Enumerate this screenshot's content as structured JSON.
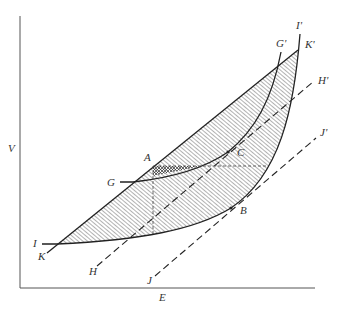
{
  "axes": {
    "x_label": "E",
    "y_label": "V"
  },
  "points": {
    "A": "A",
    "B": "B",
    "C": "C",
    "G": "G",
    "G_prime": "G'",
    "H": "H",
    "H_prime": "H'",
    "I": "I",
    "I_prime": "I'",
    "J": "J",
    "J_prime": "J'",
    "K": "K",
    "K_prime": "K'"
  },
  "colors": {
    "line": "#222222",
    "axis": "#555555",
    "hatch": "#444444",
    "background": "#ffffff"
  }
}
